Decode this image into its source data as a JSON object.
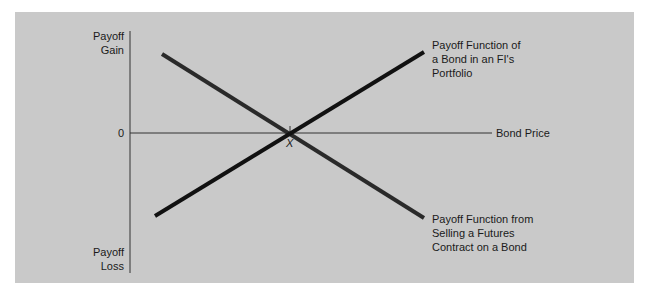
{
  "figure": {
    "y_axis": {
      "top_label": [
        "Payoff",
        "Gain"
      ],
      "bottom_label": [
        "Payoff",
        "Loss"
      ],
      "zero_label": "0"
    },
    "x_axis": {
      "label": "Bond Price",
      "crossing_point_label": "X"
    },
    "lines": [
      {
        "name": "bond-payoff",
        "label": [
          "Payoff Function of",
          "a Bond in an FI's",
          "Portfolio"
        ],
        "direction": "upward",
        "color": "#111111"
      },
      {
        "name": "futures-short-payoff",
        "label": [
          "Payoff Function from",
          "Selling a Futures",
          "Contract on a Bond"
        ],
        "direction": "downward",
        "color": "#2a2a2a"
      }
    ],
    "colors": {
      "background": "#c9c9c9",
      "axis": "#333333",
      "text": "#1a1a1a"
    }
  }
}
